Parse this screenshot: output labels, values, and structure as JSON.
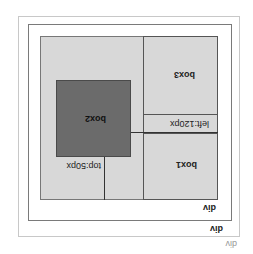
{
  "orientation": "rotated-180",
  "labels": {
    "outer_div": "div",
    "middle_div": "div",
    "inner_div": "div",
    "box1": "box1",
    "box2": "box2",
    "box3": "box3",
    "left_annotation": "left:120px",
    "top_annotation": "top:50px"
  },
  "colors": {
    "background": "#ffffff",
    "container": "#d8d8d8",
    "box2": "#6b6b6b",
    "lines": "#333333"
  }
}
